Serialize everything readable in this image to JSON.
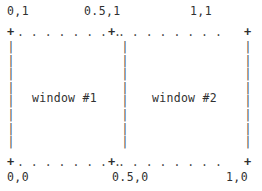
{
  "diagram": {
    "type": "normalized-coordinate-window-layout",
    "corner_labels": {
      "top_left": "0,1",
      "top_mid": "0.5,1",
      "top_right": "1,1",
      "bottom_left": "0,0",
      "bottom_mid": "0.5,0",
      "bottom_right": "1,0"
    },
    "ticks": {
      "top_left": "+",
      "top_mid": "+",
      "top_right": "+",
      "bottom_left": "+",
      "bottom_mid": "+",
      "bottom_right": "+"
    },
    "edges": {
      "top_left_run": ". . . . . . . .",
      "top_right_run": ". . . . . . . .",
      "bottom_left_run": ". . . . . . . .",
      "bottom_right_run": ". . . . . . . .",
      "left_column": "|\n|\n|\n|\n|\n|\n|\n|",
      "middle_column": "|\n|\n|\n|\n|\n|\n|\n|",
      "right_column": "|\n|\n|\n|\n|\n|\n|\n|"
    },
    "windows": [
      {
        "label": "window #1"
      },
      {
        "label": "window #2"
      }
    ]
  },
  "colors": {
    "text": "#303030",
    "rule": "#4a4a4a",
    "background": "#ffffff"
  }
}
